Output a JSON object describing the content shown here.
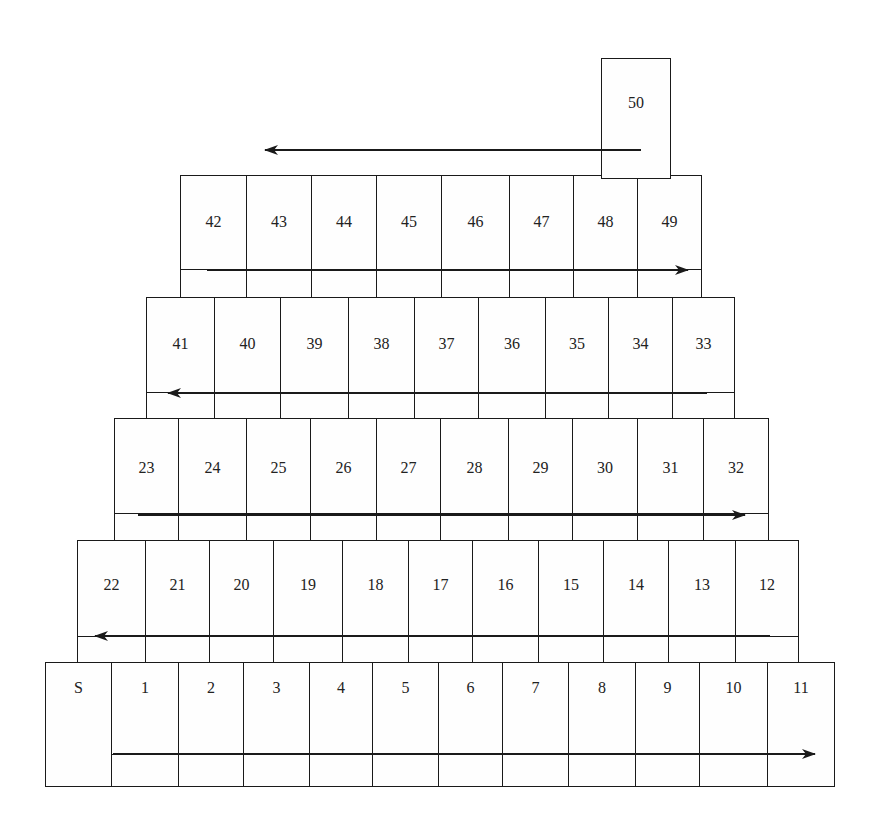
{
  "board": {
    "rows": [
      {
        "top": 662,
        "bottom": 786,
        "label_y": 688,
        "lane_y": 754,
        "lane_from": 111,
        "edges": [
          45,
          111,
          178,
          243,
          309,
          372,
          438,
          502,
          568,
          635,
          699,
          767,
          834
        ],
        "labels": [
          "S",
          "1",
          "2",
          "3",
          "4",
          "5",
          "6",
          "7",
          "8",
          "9",
          "10",
          "11"
        ],
        "arrow": {
          "from": 113,
          "to": 815,
          "y": 754,
          "direction": "right"
        }
      },
      {
        "top": 540,
        "bottom": 662,
        "label_y": 585,
        "lane_y": 636,
        "lane_from": 77,
        "edges": [
          77,
          145,
          209,
          273,
          342,
          408,
          472,
          538,
          603,
          668,
          735,
          798
        ],
        "labels": [
          "22",
          "21",
          "20",
          "19",
          "18",
          "17",
          "16",
          "15",
          "14",
          "13",
          "12"
        ],
        "arrow": {
          "from": 770,
          "to": 95,
          "y": 636,
          "direction": "left"
        }
      },
      {
        "top": 418,
        "bottom": 540,
        "label_y": 468,
        "lane_y": 513,
        "lane_from": 114,
        "edges": [
          114,
          178,
          246,
          310,
          376,
          440,
          508,
          572,
          637,
          703,
          768
        ],
        "labels": [
          "23",
          "24",
          "25",
          "26",
          "27",
          "28",
          "29",
          "30",
          "31",
          "32"
        ],
        "arrow": {
          "from": 138,
          "to": 745,
          "y": 515,
          "direction": "right"
        }
      },
      {
        "top": 297,
        "bottom": 418,
        "label_y": 344,
        "lane_y": 392,
        "lane_from": 146,
        "edges": [
          146,
          214,
          280,
          348,
          414,
          478,
          545,
          608,
          672,
          734
        ],
        "labels": [
          "41",
          "40",
          "39",
          "38",
          "37",
          "36",
          "35",
          "34",
          "33"
        ],
        "arrow": {
          "from": 707,
          "to": 168,
          "y": 393,
          "direction": "left"
        }
      },
      {
        "top": 175,
        "bottom": 297,
        "label_y": 222,
        "lane_y": 269,
        "lane_from": 180,
        "edges": [
          180,
          246,
          311,
          376,
          441,
          509,
          573,
          637,
          701
        ],
        "labels": [
          "42",
          "43",
          "44",
          "45",
          "46",
          "47",
          "48",
          "49"
        ],
        "arrow": {
          "from": 207,
          "to": 688,
          "y": 270,
          "direction": "right"
        }
      }
    ],
    "finish": {
      "label": "50",
      "left": 601,
      "right": 670,
      "top": 58,
      "bottom": 178,
      "label_y": 103,
      "arrow": {
        "from": 641,
        "to": 265,
        "y": 150,
        "direction": "left"
      }
    },
    "colors": {
      "line": "#1a1a1a",
      "text": "#222222",
      "background": "#ffffff"
    }
  }
}
